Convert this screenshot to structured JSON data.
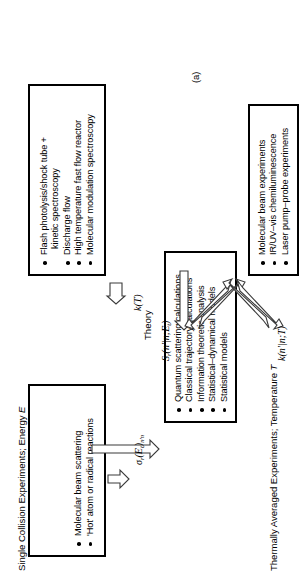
{
  "figure": {
    "caption": "(a)",
    "theory_label": "Theory",
    "headers": {
      "single_collision": {
        "text": "Single Collision Experiments; Energy ",
        "italic_symbol": "E"
      },
      "thermally_averaged": {
        "text": "Thermally Averaged Experiments; Temperature ",
        "italic_symbol": "T"
      }
    },
    "boxes": [
      {
        "id": "single-collision-experiments",
        "items": [
          {
            "text": "Molecular beam scattering",
            "bullet": true
          },
          {
            "text": "'Hot' atom or radical reactions",
            "bullet": true
          }
        ]
      },
      {
        "id": "theory-methods",
        "items": [
          {
            "text": "Quantum scattering calculations",
            "bullet": true
          },
          {
            "text": "Classical trajectory calculations",
            "bullet": true
          },
          {
            "text": "Information theoretic analysis",
            "bullet": true
          },
          {
            "text": "Statistical–dynamical models",
            "bullet": true
          },
          {
            "text": "Statistical models",
            "bullet": true
          }
        ]
      },
      {
        "id": "thermally-averaged-experiments",
        "items": [
          {
            "text": "Flash photolysis/shock tube +",
            "bullet": true
          },
          {
            "text": "kinetic spectroscopy",
            "bullet": false
          },
          {
            "text": "Discharge flow",
            "bullet": true
          },
          {
            "text": "High temperature fast flow reactor",
            "bullet": true
          },
          {
            "text": "Molecular modulation spectroscopy",
            "bullet": true
          }
        ]
      },
      {
        "id": "state-resolved-experiments",
        "items": [
          {
            "text": "Molecular beam experiments",
            "bullet": true
          },
          {
            "text": "IR/UV–vis chemiluminescence",
            "bullet": true
          },
          {
            "text": "Laser pump–probe experiments",
            "bullet": true
          }
        ]
      }
    ],
    "arrow_labels": {
      "cross_section": {
        "symbol": "σ",
        "sub1": "r",
        "arg": "(E",
        "sub2": "t",
        "close": ")",
        "sub3": "n'n",
        "full": "σr(Et)n'n"
      },
      "state_to_state_cross_section": {
        "symbol": "S",
        "sub1": "r",
        "arg": "(n'|n;E",
        "sub2": "t",
        "close": ")",
        "full": "Sr(n'|n;Et)"
      },
      "state_to_state_rate": {
        "symbol": "k",
        "arg": "(n'|n;T)",
        "full": "k(n'|n;T)"
      },
      "thermal_rate": {
        "symbol": "k",
        "arg": "(T)",
        "full": "k(T)"
      }
    },
    "colors": {
      "ink": "#000000",
      "arrow_stroke": "#3a3a3a",
      "background": "#ffffff"
    }
  }
}
